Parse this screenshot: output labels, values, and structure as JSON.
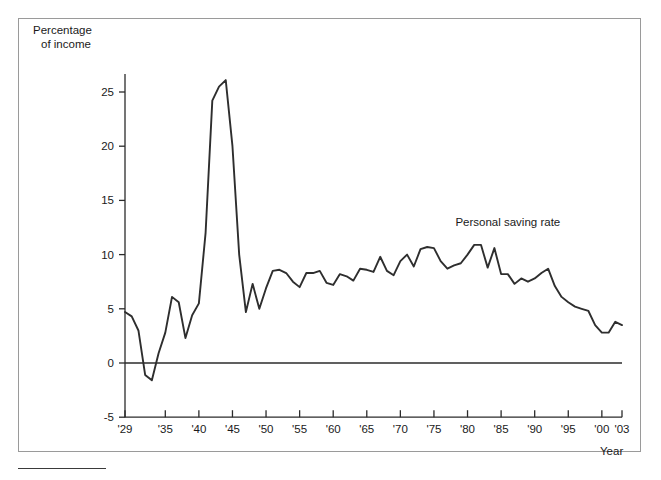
{
  "figure": {
    "y_axis_title_line1": "Percentage",
    "y_axis_title_line2": "of income",
    "x_axis_title": "Year",
    "series_label": "Personal saving rate"
  },
  "colors": {
    "line": "#2e2e2e",
    "axis": "#2b2b2b",
    "frame": "#9a9a9a",
    "background": "#ffffff",
    "text": "#1a1a1a"
  },
  "chart_data": {
    "type": "line",
    "title": "",
    "subtitle": "",
    "xlabel": "Year",
    "ylabel": "Percentage of income",
    "xlim": [
      1929,
      2003
    ],
    "ylim": [
      -5,
      27
    ],
    "grid": false,
    "legend": "inline-label",
    "legend_position": "upper-right-inside",
    "y_ticks": [
      -5,
      0,
      5,
      10,
      15,
      20,
      25
    ],
    "y_tick_labels": [
      "-5",
      "0",
      "5",
      "10",
      "15",
      "20",
      "25"
    ],
    "x_ticks": [
      1929,
      1935,
      1940,
      1945,
      1950,
      1955,
      1960,
      1965,
      1970,
      1975,
      1980,
      1985,
      1990,
      1995,
      2000,
      2003
    ],
    "x_tick_labels": [
      "'29",
      "'35",
      "'40",
      "'45",
      "'50",
      "'55",
      "'60",
      "'65",
      "'70",
      "'75",
      "'80",
      "'85",
      "'90",
      "'95",
      "'00",
      "'03"
    ],
    "annotations": [
      {
        "text": "Personal saving rate",
        "x": 1986,
        "y": 12.6
      }
    ],
    "series": [
      {
        "name": "Personal saving rate",
        "x": [
          1929,
          1930,
          1931,
          1932,
          1933,
          1934,
          1935,
          1936,
          1937,
          1938,
          1939,
          1940,
          1941,
          1942,
          1943,
          1944,
          1945,
          1946,
          1947,
          1948,
          1949,
          1950,
          1951,
          1952,
          1953,
          1954,
          1955,
          1956,
          1957,
          1958,
          1959,
          1960,
          1961,
          1962,
          1963,
          1964,
          1965,
          1966,
          1967,
          1968,
          1969,
          1970,
          1971,
          1972,
          1973,
          1974,
          1975,
          1976,
          1977,
          1978,
          1979,
          1980,
          1981,
          1982,
          1983,
          1984,
          1985,
          1986,
          1987,
          1988,
          1989,
          1990,
          1991,
          1992,
          1993,
          1994,
          1995,
          1996,
          1997,
          1998,
          1999,
          2000,
          2001,
          2002,
          2003
        ],
        "values": [
          4.7,
          4.3,
          3.0,
          -1.1,
          -1.6,
          0.9,
          2.8,
          6.1,
          5.6,
          2.3,
          4.4,
          5.5,
          12.0,
          24.2,
          25.5,
          26.1,
          20.0,
          10.0,
          4.7,
          7.3,
          5.0,
          6.9,
          8.5,
          8.6,
          8.3,
          7.5,
          7.0,
          8.3,
          8.3,
          8.5,
          7.4,
          7.2,
          8.2,
          8.0,
          7.6,
          8.7,
          8.6,
          8.4,
          9.8,
          8.5,
          8.1,
          9.4,
          10.0,
          8.9,
          10.5,
          10.7,
          10.6,
          9.4,
          8.7,
          9.0,
          9.2,
          10.0,
          10.9,
          10.9,
          8.8,
          10.6,
          8.2,
          8.2,
          7.3,
          7.8,
          7.5,
          7.8,
          8.3,
          8.7,
          7.1,
          6.1,
          5.6,
          5.2,
          5.0,
          4.8,
          3.5,
          2.8,
          2.8,
          3.8,
          3.5
        ]
      }
    ]
  }
}
